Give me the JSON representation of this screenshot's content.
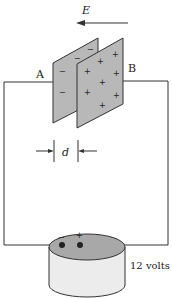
{
  "diagram": {
    "field_label": "E",
    "plate_a_label": "A",
    "plate_b_label": "B",
    "separation_label": "d",
    "battery_label": "12 volts",
    "battery_negative": "−",
    "battery_positive": "+",
    "plate_a_charge": "−",
    "plate_b_charge": "+",
    "colors": {
      "plate_fill": "#b8b8b8",
      "battery_top": "#a8a8a8",
      "battery_body": "#ececec",
      "line": "#333333"
    }
  }
}
